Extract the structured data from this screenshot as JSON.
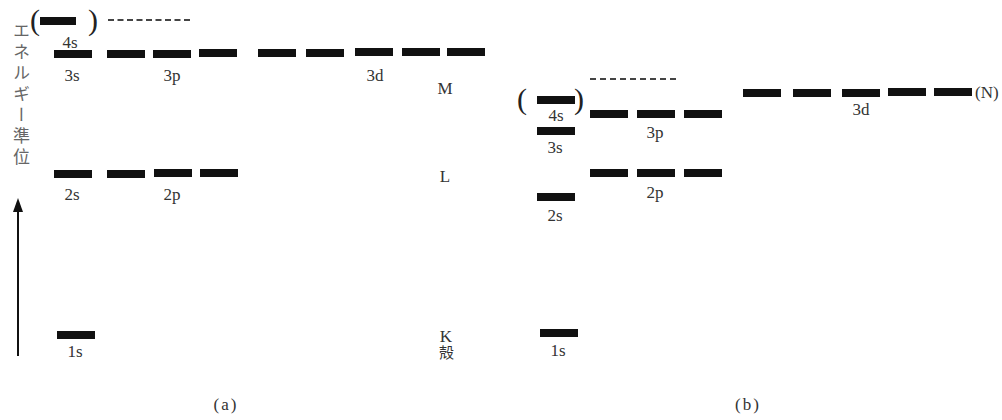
{
  "axis": {
    "label": "エネルギー準位"
  },
  "panel_a": {
    "caption": "(a)",
    "labels": {
      "s4": "4s",
      "s3": "3s",
      "p3": "3p",
      "d3": "3d",
      "s2": "2s",
      "p2": "2p",
      "s1": "1s"
    },
    "shells": {
      "M": "M",
      "L": "L",
      "K": "K",
      "kaku": "殻"
    },
    "parens": {
      "open": "(",
      "close": ")"
    }
  },
  "panel_b": {
    "caption": "(b)",
    "labels": {
      "s4": "4s",
      "s3": "3s",
      "p3": "3p",
      "d3": "3d",
      "s2": "2s",
      "p2": "2p",
      "s1": "1s"
    },
    "shells": {
      "N": "(N)"
    },
    "parens": {
      "open": "(",
      "close": ")"
    }
  }
}
